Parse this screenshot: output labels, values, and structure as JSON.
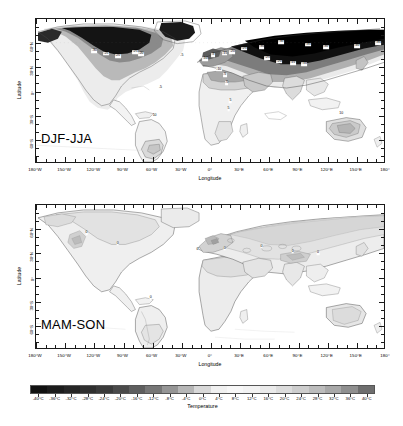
{
  "figure": {
    "background": "#ffffff",
    "panels": [
      {
        "tag": "DJF-JJA",
        "xlabel": "Longitude",
        "ylabel": "Latitude",
        "xticks": [
          "180°W",
          "150°W",
          "120°W",
          "90°W",
          "60°W",
          "30°W",
          "0°",
          "30°E",
          "60°E",
          "90°E",
          "120°E",
          "150°E",
          "180°"
        ],
        "xtick_values": [
          -180,
          -150,
          -120,
          -90,
          -60,
          -30,
          0,
          30,
          60,
          90,
          120,
          150,
          180
        ],
        "yticks": [
          "60°N",
          "30°N",
          "0°",
          "30°S",
          "60°S"
        ],
        "ytick_values": [
          60,
          30,
          0,
          -30,
          -60
        ],
        "contour_labels": [
          {
            "text": "-30",
            "x": -120,
            "y": 50
          },
          {
            "text": "-25",
            "x": -108,
            "y": 47
          },
          {
            "text": "-20",
            "x": -96,
            "y": 44
          },
          {
            "text": "-25",
            "x": -78,
            "y": 49
          },
          {
            "text": "-20",
            "x": -72,
            "y": 46
          },
          {
            "text": "-5",
            "x": -30,
            "y": 44
          },
          {
            "text": "-5",
            "x": 2,
            "y": 45
          },
          {
            "text": "-10",
            "x": -6,
            "y": 40
          },
          {
            "text": "-15",
            "x": 14,
            "y": 47
          },
          {
            "text": "-20",
            "x": 22,
            "y": 49
          },
          {
            "text": "-25",
            "x": 34,
            "y": 53
          },
          {
            "text": "-30",
            "x": 52,
            "y": 55
          },
          {
            "text": "-35",
            "x": 72,
            "y": 61
          },
          {
            "text": "-35",
            "x": 100,
            "y": 58
          },
          {
            "text": "-30",
            "x": 118,
            "y": 55
          },
          {
            "text": "-40",
            "x": 150,
            "y": 56
          },
          {
            "text": "-35",
            "x": 172,
            "y": 60
          },
          {
            "text": "-25",
            "x": 58,
            "y": 41
          },
          {
            "text": "-20",
            "x": 70,
            "y": 37
          },
          {
            "text": "-15",
            "x": 84,
            "y": 35
          },
          {
            "text": "-10",
            "x": 96,
            "y": 34
          },
          {
            "text": "-10",
            "x": 8,
            "y": 27
          },
          {
            "text": "-5",
            "x": 14,
            "y": 20
          },
          {
            "text": "-5",
            "x": 16,
            "y": 10
          },
          {
            "text": "-5",
            "x": -52,
            "y": 4
          },
          {
            "text": "5",
            "x": 20,
            "y": -12
          },
          {
            "text": "5",
            "x": 18,
            "y": -22
          },
          {
            "text": "10",
            "x": -58,
            "y": -30
          },
          {
            "text": "10",
            "x": 134,
            "y": -28
          }
        ]
      },
      {
        "tag": "MAM-SON",
        "xlabel": "Longitude",
        "ylabel": "Latitude",
        "xticks": [
          "180°W",
          "150°W",
          "120°W",
          "90°W",
          "60°W",
          "30°W",
          "0°",
          "30°E",
          "60°E",
          "90°E",
          "120°E",
          "150°E",
          "180°"
        ],
        "xtick_values": [
          -180,
          -150,
          -120,
          -90,
          -60,
          -30,
          0,
          30,
          60,
          90,
          120,
          150,
          180
        ],
        "yticks": [
          "60°N",
          "30°N",
          "0°",
          "30°S",
          "60°S"
        ],
        "ytick_values": [
          60,
          30,
          0,
          -30,
          -60
        ],
        "contour_labels": [
          {
            "text": "0",
            "x": -128,
            "y": 55
          },
          {
            "text": "0",
            "x": -96,
            "y": 42
          },
          {
            "text": "0",
            "x": -14,
            "y": 34
          },
          {
            "text": "0",
            "x": 14,
            "y": 36
          },
          {
            "text": "0",
            "x": 52,
            "y": 38
          },
          {
            "text": "0",
            "x": 84,
            "y": 32
          },
          {
            "text": "0",
            "x": 110,
            "y": 30
          },
          {
            "text": "0",
            "x": -62,
            "y": -26
          }
        ]
      }
    ]
  },
  "colorbar": {
    "title": "Temperature",
    "vmin": -40,
    "vmax": 40,
    "step": 4,
    "labels": [
      "-40°C",
      "-36°C",
      "-32°C",
      "-28°C",
      "-24°C",
      "-20°C",
      "-16°C",
      "-12°C",
      "-8°C",
      "-4°C",
      "0°C",
      "4°C",
      "8°C",
      "12°C",
      "16°C",
      "20°C",
      "24°C",
      "28°C",
      "32°C",
      "36°C",
      "40°C"
    ],
    "values": [
      -40,
      -36,
      -32,
      -28,
      -24,
      -20,
      -16,
      -12,
      -8,
      -4,
      0,
      4,
      8,
      12,
      16,
      20,
      24,
      28,
      32,
      36,
      40
    ],
    "colors": [
      "#111111",
      "#1c1c1c",
      "#262626",
      "#2f2f2f",
      "#3a3a3a",
      "#4a4a4a",
      "#5e5e5e",
      "#767676",
      "#959595",
      "#b6b6b6",
      "#d8d8d8",
      "#f0f0f0",
      "#f7f7f7",
      "#f2f2f2",
      "#eaeaea",
      "#dcdcdc",
      "#cdcdcd",
      "#bcbcbc",
      "#a8a8a8",
      "#8f8f8f",
      "#6e6e6e"
    ],
    "colormap": "grayscale-diverging"
  },
  "chart_data": {
    "type": "heatmap",
    "title": "",
    "subtitle": "",
    "xlabel": "Longitude",
    "ylabel": "Latitude",
    "xlim": [
      -180,
      180
    ],
    "ylim": [
      -90,
      90
    ],
    "grid": false,
    "legend": "bottom-colorbar",
    "variable": "Temperature",
    "units": "°C",
    "panels": [
      {
        "name": "DJF-JJA",
        "description": "Seasonal temperature difference between December-January-February and June-July-August",
        "contour_levels": [
          -40,
          -35,
          -30,
          -25,
          -20,
          -15,
          -10,
          -5,
          0,
          5,
          10,
          15
        ],
        "value_range": [
          -45,
          15
        ],
        "regions": [
          {
            "region": "Siberia",
            "lon": 100,
            "lat": 62,
            "value": -40
          },
          {
            "region": "Northeast Siberia",
            "lon": 150,
            "lat": 65,
            "value": -45
          },
          {
            "region": "Central Canada",
            "lon": -100,
            "lat": 62,
            "value": -35
          },
          {
            "region": "Greenland",
            "lon": -42,
            "lat": 72,
            "value": -32
          },
          {
            "region": "Western USA",
            "lon": -112,
            "lat": 40,
            "value": -18
          },
          {
            "region": "Eastern USA",
            "lon": -80,
            "lat": 40,
            "value": -22
          },
          {
            "region": "Western Europe",
            "lon": 5,
            "lat": 48,
            "value": -12
          },
          {
            "region": "Eastern Europe",
            "lon": 30,
            "lat": 52,
            "value": -22
          },
          {
            "region": "Central Asia",
            "lon": 70,
            "lat": 45,
            "value": -28
          },
          {
            "region": "East Asia",
            "lon": 110,
            "lat": 38,
            "value": -20
          },
          {
            "region": "North Africa Sahara",
            "lon": 10,
            "lat": 24,
            "value": -12
          },
          {
            "region": "Equatorial Africa",
            "lon": 20,
            "lat": 0,
            "value": -1
          },
          {
            "region": "Amazon",
            "lon": -60,
            "lat": -5,
            "value": 2
          },
          {
            "region": "Southern South America",
            "lon": -62,
            "lat": -32,
            "value": 10
          },
          {
            "region": "Southern Africa",
            "lon": 24,
            "lat": -24,
            "value": 7
          },
          {
            "region": "Australia",
            "lon": 134,
            "lat": -26,
            "value": 11
          },
          {
            "region": "India",
            "lon": 78,
            "lat": 22,
            "value": -9
          },
          {
            "region": "Oceans",
            "lon": 0,
            "lat": 0,
            "value": 0
          }
        ]
      },
      {
        "name": "MAM-SON",
        "description": "Seasonal temperature difference between March-April-May and September-October-November",
        "contour_levels": [
          -8,
          -4,
          0,
          4
        ],
        "value_range": [
          -8,
          6
        ],
        "regions": [
          {
            "region": "Siberia",
            "lon": 100,
            "lat": 62,
            "value": -5
          },
          {
            "region": "Northern Canada",
            "lon": -100,
            "lat": 65,
            "value": -4
          },
          {
            "region": "Greenland",
            "lon": -42,
            "lat": 72,
            "value": -3
          },
          {
            "region": "Western USA",
            "lon": -112,
            "lat": 40,
            "value": -2
          },
          {
            "region": "Europe",
            "lon": 15,
            "lat": 50,
            "value": -3
          },
          {
            "region": "Central Asia",
            "lon": 70,
            "lat": 45,
            "value": -4
          },
          {
            "region": "East Asia",
            "lon": 110,
            "lat": 38,
            "value": -3
          },
          {
            "region": "North Africa Sahara",
            "lon": 10,
            "lat": 24,
            "value": -2
          },
          {
            "region": "Equatorial Africa",
            "lon": 20,
            "lat": 0,
            "value": -1
          },
          {
            "region": "Amazon",
            "lon": -60,
            "lat": -5,
            "value": 0
          },
          {
            "region": "Southern South America",
            "lon": -62,
            "lat": -32,
            "value": 2
          },
          {
            "region": "Southern Africa",
            "lon": 24,
            "lat": -24,
            "value": 1
          },
          {
            "region": "Australia",
            "lon": 134,
            "lat": -26,
            "value": 2
          },
          {
            "region": "India",
            "lon": 78,
            "lat": 22,
            "value": -3
          },
          {
            "region": "Oceans",
            "lon": 0,
            "lat": 0,
            "value": 0
          }
        ]
      }
    ]
  }
}
